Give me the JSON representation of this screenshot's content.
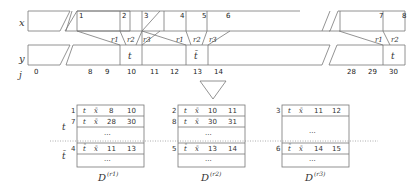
{
  "rows": {
    "x_label": "x",
    "y_label": "y",
    "j_label": "j"
  },
  "x_markers": [
    "1",
    "2",
    "3",
    "4",
    "5",
    "6",
    "7",
    "8"
  ],
  "r_labels": [
    "r1",
    "r2",
    "r3",
    "r1",
    "r2",
    "r3",
    "r1",
    "r2"
  ],
  "y_cells": {
    "t1": "t",
    "tbar": "t̄",
    "t2": "t"
  },
  "j_indices": [
    "0",
    "8",
    "9",
    "10",
    "11",
    "12",
    "13",
    "14",
    "28",
    "29",
    "30"
  ],
  "tables": [
    {
      "caption": "D",
      "sup": "(r1)",
      "group_t_label": "t",
      "group_tbar_label": "t̄",
      "rows": [
        {
          "idx": "1",
          "a": "t",
          "b": "x̄",
          "c": "8",
          "d": "10"
        },
        {
          "idx": "7",
          "a": "t",
          "b": "x̄",
          "c": "28",
          "d": "30"
        },
        {
          "idx": "",
          "a": "",
          "b": "",
          "c": "···",
          "d": ""
        },
        {
          "idx": "4",
          "a": "t̄",
          "b": "x̄",
          "c": "11",
          "d": "13"
        },
        {
          "idx": "",
          "a": "",
          "b": "",
          "c": "···",
          "d": ""
        }
      ]
    },
    {
      "caption": "D",
      "sup": "(r2)",
      "rows": [
        {
          "idx": "2",
          "a": "t",
          "b": "x̄",
          "c": "10",
          "d": "11"
        },
        {
          "idx": "8",
          "a": "t",
          "b": "x̄",
          "c": "30",
          "d": "31"
        },
        {
          "idx": "",
          "a": "",
          "b": "",
          "c": "···",
          "d": ""
        },
        {
          "idx": "5",
          "a": "t̄",
          "b": "x̄",
          "c": "13",
          "d": "14"
        },
        {
          "idx": "",
          "a": "",
          "b": "",
          "c": "···",
          "d": ""
        }
      ]
    },
    {
      "caption": "D",
      "sup": "(r3)",
      "rows": [
        {
          "idx": "3",
          "a": "t",
          "b": "x̄",
          "c": "11",
          "d": "12"
        },
        {
          "idx": "",
          "a": "",
          "b": "",
          "c": "···",
          "d": ""
        },
        {
          "idx": "6",
          "a": "t̄",
          "b": "x̄",
          "c": "14",
          "d": "15"
        },
        {
          "idx": "",
          "a": "",
          "b": "",
          "c": "···",
          "d": ""
        }
      ]
    }
  ]
}
